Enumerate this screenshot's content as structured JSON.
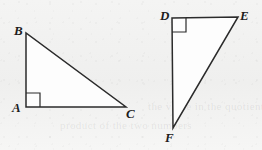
{
  "figure": {
    "background_color": "#f2f2f1",
    "stroke_color": "#2b2b2b",
    "fill_color": "#fdfdfd",
    "ghost_text": {
      "line_1": "the value in the quotient is",
      "line_2": "product of the two numbers"
    },
    "shapes": [
      {
        "name": "triangle-abc",
        "vertices": [
          {
            "label": "A",
            "x": 26,
            "y": 107,
            "right_angle": true
          },
          {
            "label": "B",
            "x": 26,
            "y": 33,
            "right_angle": false
          },
          {
            "label": "C",
            "x": 126,
            "y": 107,
            "right_angle": false
          }
        ],
        "edges": [
          "AB",
          "AC",
          "BC"
        ],
        "right_angle_vertex": "A"
      },
      {
        "name": "triangle-def",
        "vertices": [
          {
            "label": "D",
            "x": 172,
            "y": 18,
            "right_angle": true
          },
          {
            "label": "E",
            "x": 238,
            "y": 17,
            "right_angle": false
          },
          {
            "label": "F",
            "x": 173,
            "y": 128,
            "right_angle": false
          }
        ],
        "edges": [
          "DE",
          "DF",
          "EF"
        ],
        "right_angle_vertex": "D"
      }
    ],
    "labels": {
      "A": "A",
      "B": "B",
      "C": "C",
      "D": "D",
      "E": "E",
      "F": "F"
    }
  }
}
